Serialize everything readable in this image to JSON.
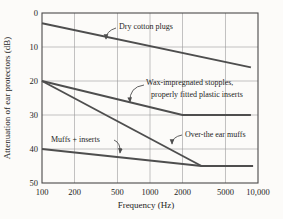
{
  "figure": {
    "background": "#fcfbf9",
    "line_color": "#4e4e4e",
    "grid_color": "#9b9b9b",
    "border_color": "#4a4a4a",
    "text_color": "#1e1e1e"
  },
  "chart_data": {
    "type": "line",
    "title": "",
    "xlabel": "Frequency (Hz)",
    "ylabel": "Attenuation of ear protectors (dB)",
    "x_scale": "log",
    "xlim": [
      100,
      10000
    ],
    "ylim": [
      0,
      50
    ],
    "y_inverted": true,
    "grid": true,
    "legend_position": "none",
    "x_ticks": [
      100,
      200,
      500,
      1000,
      2000,
      5000,
      10000
    ],
    "x_tick_labels": [
      "100",
      "200",
      "500",
      "1000",
      "2000",
      "5000",
      "10,000"
    ],
    "y_ticks": [
      0,
      10,
      20,
      30,
      40,
      50
    ],
    "y_tick_labels": [
      "0",
      "10",
      "20",
      "30",
      "40",
      "50"
    ],
    "series": [
      {
        "name": "Dry cotton plugs",
        "points": [
          [
            100,
            3
          ],
          [
            8600,
            16
          ]
        ]
      },
      {
        "name": "Wax-impregnated stopples, properly fitted plastic inserts",
        "points": [
          [
            100,
            20
          ],
          [
            2000,
            30
          ],
          [
            8600,
            30
          ]
        ]
      },
      {
        "name": "Over-the ear muffs",
        "points": [
          [
            100,
            20
          ],
          [
            3000,
            45
          ]
        ]
      },
      {
        "name": "Muffs + inserts",
        "points": [
          [
            100,
            40
          ],
          [
            3000,
            45
          ],
          [
            9000,
            45
          ]
        ]
      }
    ],
    "annotations": [
      {
        "id": "dry-cotton-plugs",
        "text_lines": [
          "Dry cotton plugs"
        ],
        "text_xy": [
          119,
          29
        ],
        "indents": [
          0
        ],
        "line_height": 12,
        "arrow_from": [
          116,
          28
        ],
        "bend": [
          106,
          31
        ],
        "arrow_to": [
          106,
          39
        ]
      },
      {
        "id": "wax-impregnated-stopples",
        "text_lines": [
          "Wax-impregnated stopples,",
          "properly fitted plastic inserts"
        ],
        "text_xy": [
          146,
          85
        ],
        "indents": [
          0,
          5
        ],
        "line_height": 12,
        "arrow_from": [
          144,
          85
        ],
        "bend": [
          129,
          87
        ],
        "arrow_to": [
          130,
          102
        ]
      },
      {
        "id": "over-the-ear-muffs",
        "text_lines": [
          "Over-the ear muffs"
        ],
        "text_xy": [
          185,
          137
        ],
        "indents": [
          0
        ],
        "line_height": 12,
        "arrow_from": [
          182,
          135
        ],
        "bend": [
          172,
          137
        ],
        "arrow_to": [
          172,
          144
        ]
      },
      {
        "id": "muffs-plus-inserts",
        "text_lines": [
          "Muffs + inserts"
        ],
        "text_xy": [
          51,
          142
        ],
        "indents": [
          0
        ],
        "line_height": 12,
        "arrow_from": [
          114,
          140
        ],
        "bend": [
          121,
          143
        ],
        "arrow_to": [
          120,
          153
        ]
      }
    ]
  }
}
